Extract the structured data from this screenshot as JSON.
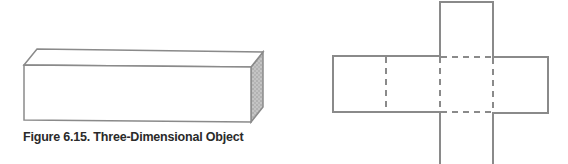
{
  "figure_3d": {
    "caption": "Figure 6.15. Three-Dimensional Object",
    "stroke_color": "#8a8a8a",
    "shade_color": "#a8a8a8"
  },
  "figure_net": {
    "solid_color": "#8a8a8a",
    "dashed_color": "#8a8a8a"
  }
}
